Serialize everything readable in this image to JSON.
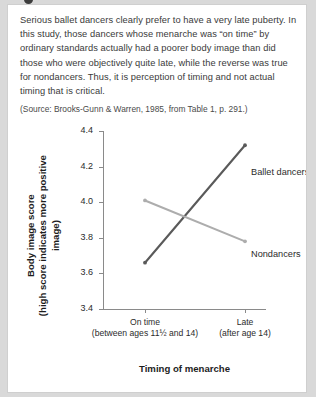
{
  "card": {
    "paragraph": "Serious ballet dancers clearly prefer to have a very late puberty. In this study, those dancers whose menarche was “on time” by ordinary standards actually had a poorer body image than did those who were objectively quite late, while the reverse was true for nondancers. Thus, it is perception of timing and not actual timing that is critical.",
    "source": "(Source: Brooks-Gunn & Warren, 1985, from Table 1, p. 291.)"
  },
  "chart_data": {
    "type": "line",
    "title": "",
    "xlabel": "Timing of menarche",
    "ylabel": "Body image score",
    "ylabel_sub": "(high score indicates more positive image)",
    "categories": [
      "On time",
      "Late"
    ],
    "category_sublabels": [
      "(between ages 11½ and 14)",
      "(after age 14)"
    ],
    "ylim": [
      3.4,
      4.4
    ],
    "yticks": [
      "3.4",
      "3.6",
      "3.8",
      "4.0",
      "4.2",
      "4.4"
    ],
    "grid": false,
    "legend_position": "inline-right",
    "series": [
      {
        "name": "Ballet dancers",
        "values": [
          3.66,
          4.32
        ],
        "color": "#5a5a5a"
      },
      {
        "name": "Nondancers",
        "values": [
          4.01,
          3.78
        ],
        "color": "#adadad"
      }
    ]
  }
}
